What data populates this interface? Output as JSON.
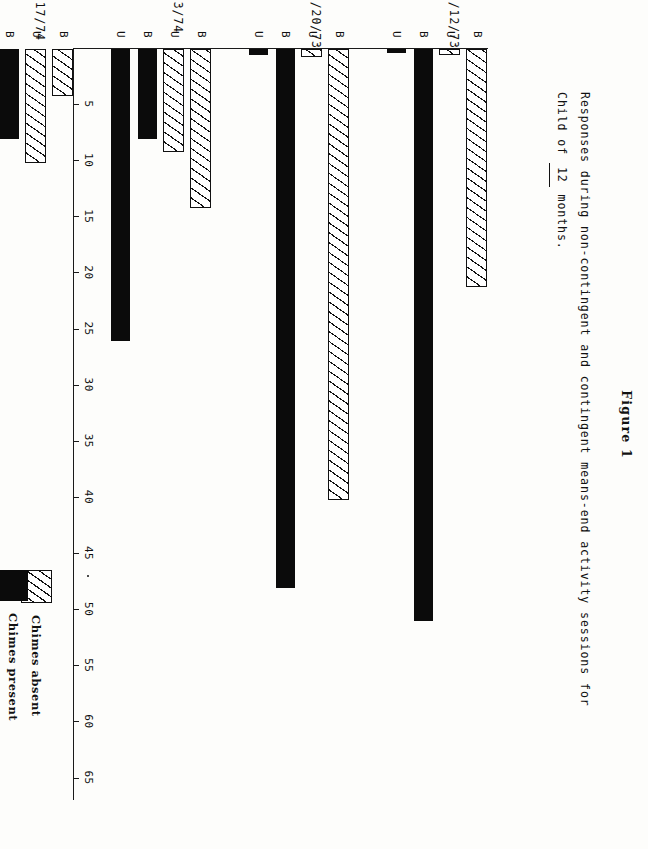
{
  "figure": {
    "label": "Figure 1",
    "title_line1": "Responses during non-contingent and contingent means-end activity sessions for",
    "title_line2_pre": "Child of",
    "title_line2_blank": "12",
    "title_line2_post": "months."
  },
  "legend": {
    "keys": [
      {
        "swatch": "hatched-swatch",
        "label": "Chimes absent"
      },
      {
        "swatch": "solid-black-swatch",
        "label": "Chimes present"
      }
    ],
    "abbreviations": [
      {
        "letter": "B",
        "meaning": "Bilateral arm movement"
      },
      {
        "letter": "U",
        "meaning": "Unilateral arm movement"
      }
    ]
  },
  "axis": {
    "ticks": [
      5,
      10,
      15,
      20,
      25,
      30,
      35,
      40,
      45,
      50,
      55,
      60,
      65
    ],
    "tick_labels": [
      "5",
      "10",
      "15",
      "20",
      "25",
      "30",
      "35",
      "40",
      "45",
      "50",
      "55",
      "60",
      "65"
    ],
    "stray_mark_after": "45"
  },
  "chart_data": {
    "type": "bar",
    "orientation": "horizontal",
    "title": "Responses during non-contingent and contingent means-end activity sessions for Child of 12 months.",
    "xlabel": "",
    "ylabel": "",
    "xlim": [
      0,
      67
    ],
    "grid": false,
    "legend_position": "bottom-right",
    "categories": [
      "12/12/73",
      "12/20/73",
      "1/3/74",
      "1/17/74"
    ],
    "bar_labels": [
      "B",
      "U",
      "B",
      "U"
    ],
    "series": [
      {
        "name": "Chimes absent",
        "style": "hatched",
        "values": {
          "12/12/73": {
            "B": 21,
            "U": 0.4
          },
          "12/20/73": {
            "B": 40,
            "U": 0.5
          },
          "1/3/74": {
            "B": 14,
            "U": 9
          },
          "1/17/74": {
            "B": 4,
            "U": 10
          }
        }
      },
      {
        "name": "Chimes present",
        "style": "solid-black",
        "values": {
          "12/12/73": {
            "B": 51,
            "U": 0.4
          },
          "12/20/73": {
            "B": 48,
            "U": 0.5
          },
          "1/3/74": {
            "B": 8,
            "U": 26
          },
          "1/17/74": {
            "B": 8,
            "U": 41
          }
        }
      }
    ],
    "bars": [
      {
        "group": "12/12/73",
        "series": "Chimes absent",
        "tag": "B",
        "value": 21
      },
      {
        "group": "12/12/73",
        "series": "Chimes absent",
        "tag": "U",
        "value": 0.4
      },
      {
        "group": "12/12/73",
        "series": "Chimes present",
        "tag": "B",
        "value": 51
      },
      {
        "group": "12/12/73",
        "series": "Chimes present",
        "tag": "U",
        "value": 0.4
      },
      {
        "group": "12/20/73",
        "series": "Chimes absent",
        "tag": "B",
        "value": 40
      },
      {
        "group": "12/20/73",
        "series": "Chimes absent",
        "tag": "U",
        "value": 0.5
      },
      {
        "group": "12/20/73",
        "series": "Chimes present",
        "tag": "B",
        "value": 48
      },
      {
        "group": "12/20/73",
        "series": "Chimes present",
        "tag": "U",
        "value": 0.5
      },
      {
        "group": "1/3/74",
        "series": "Chimes absent",
        "tag": "B",
        "value": 14
      },
      {
        "group": "1/3/74",
        "series": "Chimes absent",
        "tag": "U",
        "value": 9
      },
      {
        "group": "1/3/74",
        "series": "Chimes present",
        "tag": "B",
        "value": 8
      },
      {
        "group": "1/3/74",
        "series": "Chimes present",
        "tag": "U",
        "value": 26
      },
      {
        "group": "1/17/74",
        "series": "Chimes absent",
        "tag": "B",
        "value": 4
      },
      {
        "group": "1/17/74",
        "series": "Chimes absent",
        "tag": "U",
        "value": 10
      },
      {
        "group": "1/17/74",
        "series": "Chimes present",
        "tag": "B",
        "value": 8
      },
      {
        "group": "1/17/74",
        "series": "Chimes present",
        "tag": "U",
        "value": 41
      }
    ]
  }
}
